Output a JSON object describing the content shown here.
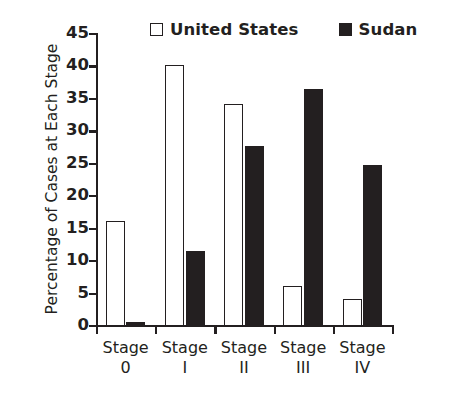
{
  "chart_data": {
    "type": "bar",
    "title": "",
    "xlabel": "",
    "ylabel": "Percentage of Cases at Each Stage",
    "categories": [
      "Stage 0",
      "Stage I",
      "Stage II",
      "Stage III",
      "Stage IV"
    ],
    "category_lines": [
      [
        "Stage",
        "0"
      ],
      [
        "Stage",
        "I"
      ],
      [
        "Stage",
        "II"
      ],
      [
        "Stage",
        "III"
      ],
      [
        "Stage",
        "IV"
      ]
    ],
    "series": [
      {
        "name": "United States",
        "swatch": "hollow",
        "color": "#ffffff",
        "edge_color": "#231f20",
        "values": [
          16.0,
          40.1,
          34.1,
          6.0,
          4.0
        ]
      },
      {
        "name": "Sudan",
        "swatch": "filled",
        "color": "#231f20",
        "edge_color": "#231f20",
        "values": [
          0.5,
          11.4,
          27.6,
          36.4,
          24.7
        ]
      }
    ],
    "yticks": [
      0,
      5,
      10,
      15,
      20,
      25,
      30,
      35,
      40,
      45
    ],
    "ytick_labels": [
      "0",
      "5",
      "10",
      "15",
      "20",
      "25",
      "30",
      "35",
      "40",
      "45"
    ],
    "ylim": [
      0,
      45
    ],
    "grid": false,
    "legend_position": "top"
  }
}
